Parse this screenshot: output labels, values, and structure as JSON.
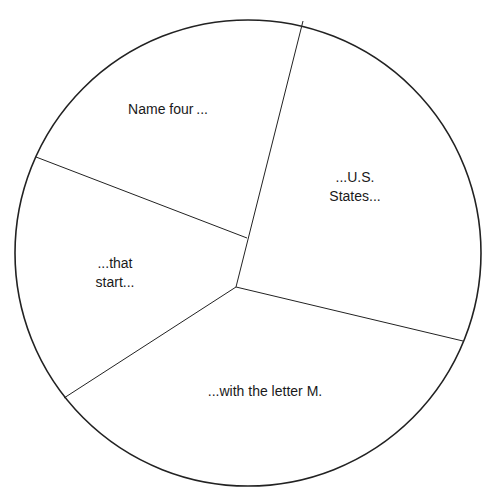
{
  "diagram": {
    "type": "pie-wedge-puzzle",
    "segments": [
      {
        "id": "top-left",
        "lines": [
          "Name four ..."
        ]
      },
      {
        "id": "right",
        "lines": [
          "...U.S.",
          "States..."
        ]
      },
      {
        "id": "left",
        "lines": [
          "...that",
          "start..."
        ]
      },
      {
        "id": "bottom",
        "lines": [
          "...with the letter M."
        ]
      }
    ]
  }
}
